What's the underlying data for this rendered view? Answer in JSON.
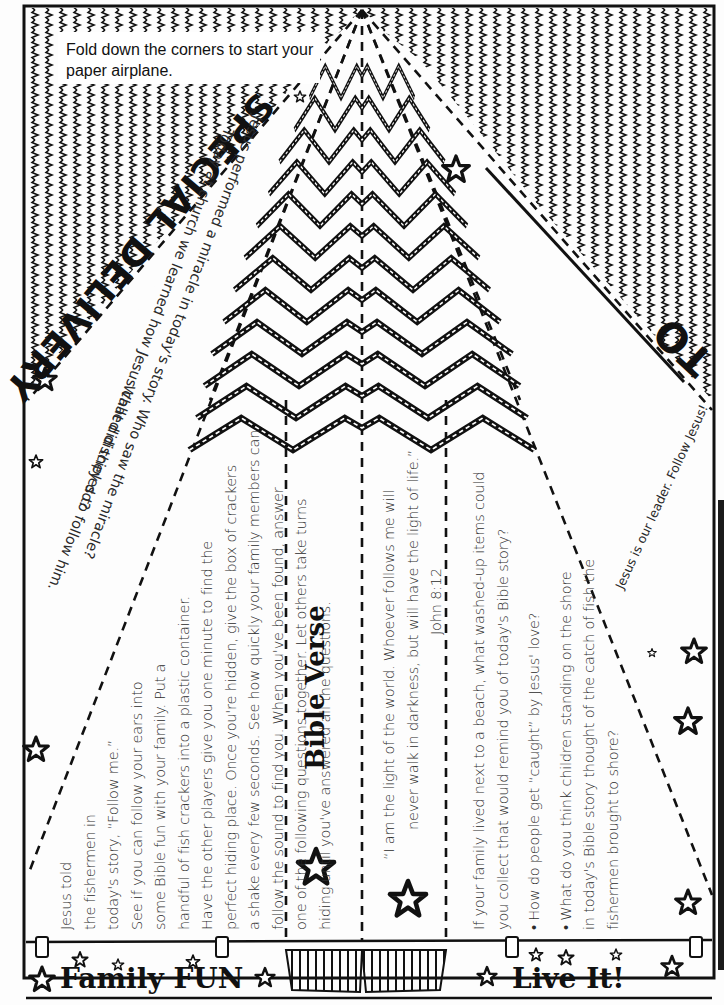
{
  "sheet": {
    "fold_instruction": "Fold down the corners to start your paper airplane.",
    "title": "SPECIAL DELIVERY",
    "to_label": "TO",
    "today_text": {
      "line1": "Today at church we learned how Jesus called disciples to follow him.",
      "line1_a": "Today at church we learned how Jesus called disciples to follow him.",
      "bullet1": "Jesus performed a miracle in today's story.  Who saw the miracle?",
      "bullet1_b": "What did they do?"
    },
    "leader_text": "Jesus is our leader. Follow Jesus!",
    "family_fun": {
      "heading": "Family FUN",
      "lines": [
        "Jesus told",
        "the fishermen in",
        "today's story, “Follow me.”",
        "See if you can follow your ears into",
        "some Bible fun with your family. Put a",
        "handful of fish crackers into a plastic container.",
        "Have the other players give you one minute to find the",
        "perfect hiding place. Once you're hidden, give the box of crackers",
        "a shake every few seconds. See how quickly your family members can",
        "follow the sound to find you. When you've been found, answer",
        "one of the following questions together. Let others take turns",
        "hiding until you've answered all the questions."
      ]
    },
    "bible_verse": {
      "heading": "Bible Verse",
      "lines": [
        "“I am the light of the world. Whoever follows me will",
        "never walk in darkness, but will have the light of life.”",
        "John 8:12"
      ]
    },
    "live_it": {
      "heading": "Live It!",
      "intro": [
        "If your family lived next to a beach, what washed-up items could",
        "you collect that would remind you of today's Bible story?"
      ],
      "questions": [
        [
          "• How do people get “caught” by Jesus' love?"
        ],
        [
          "• What do you think children standing on the shore",
          "in today's Bible story thought of the catch of fish the",
          "fishermen brought to shore?"
        ]
      ]
    }
  },
  "colors": {
    "ink": "#111111",
    "paper": "#fdfdfd",
    "body_text": "#2b2b2b"
  }
}
